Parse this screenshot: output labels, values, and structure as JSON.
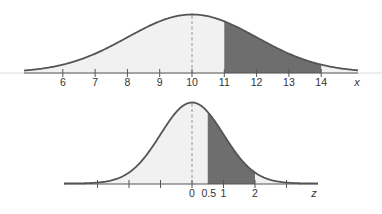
{
  "colors": {
    "curve": "#555555",
    "shade_dark": "#6e6e6e",
    "shade_light": "#f1f1f1",
    "axis": "#555555",
    "mean_line": "#888888",
    "faint_line": "#dddddd"
  },
  "chart_data": [
    {
      "type": "area",
      "title": "",
      "description": "Normal distribution of x with mean 10; area between x=11 and x=14 shaded",
      "xlabel": "x",
      "ylabel": "",
      "mean": 10,
      "sd": 2,
      "xlim": [
        4.8,
        15.2
      ],
      "ticks": [
        6,
        7,
        8,
        9,
        10,
        11,
        12,
        13,
        14
      ],
      "tick_labels": [
        "6",
        "7",
        "8",
        "9",
        "10",
        "11",
        "12",
        "13",
        "14"
      ],
      "shaded_interval": [
        11,
        14
      ],
      "mean_line": 10,
      "grid": false,
      "legend": "none"
    },
    {
      "type": "area",
      "title": "",
      "description": "Standard normal distribution of z; area between z=0.5 and z=2 shaded",
      "xlabel": "z",
      "ylabel": "",
      "mean": 0,
      "sd": 1,
      "xlim": [
        -4,
        4
      ],
      "ticks": [
        -3,
        -2,
        -1,
        0,
        0.5,
        1,
        2,
        3
      ],
      "tick_labels": [
        "",
        "",
        "",
        "0",
        "0.5",
        "1",
        "2",
        ""
      ],
      "shaded_interval": [
        0.5,
        2
      ],
      "mean_line": 0,
      "grid": false,
      "legend": "none"
    }
  ]
}
